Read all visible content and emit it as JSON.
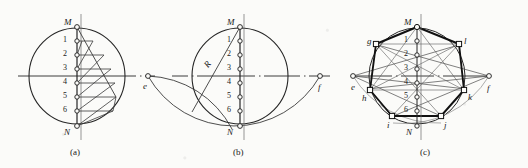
{
  "figure": {
    "captions": [
      {
        "id": "cap-a",
        "text": "(a)",
        "x": 70,
        "y": 148
      },
      {
        "id": "cap-b",
        "text": "(b)",
        "x": 233,
        "y": 148
      },
      {
        "id": "cap-c",
        "text": "(c)",
        "x": 420,
        "y": 148
      }
    ],
    "colors": {
      "ink": "#1a1a1a",
      "line": "#262626",
      "thin": "#3a3a3a",
      "paper": "#fbfbf9",
      "heavy": "#111111"
    }
  },
  "panels": {
    "a": {
      "name": "divide-diameter-panel",
      "center": {
        "x": 77,
        "y": 76
      },
      "radius": 48,
      "endpoints": [
        {
          "label": "M",
          "x": 77,
          "y": 27,
          "lx": 64,
          "ly": 18
        },
        {
          "label": "N",
          "x": 77,
          "y": 126,
          "lx": 64,
          "ly": 128
        }
      ],
      "divisions": [
        {
          "label": "1",
          "x": 77,
          "y": 41,
          "lx": 63,
          "ly": 36
        },
        {
          "label": "2",
          "x": 77,
          "y": 55,
          "lx": 63,
          "ly": 50
        },
        {
          "label": "3",
          "x": 77,
          "y": 69,
          "lx": 63,
          "ly": 64
        },
        {
          "label": "4",
          "x": 77,
          "y": 83,
          "lx": 63,
          "ly": 78
        },
        {
          "label": "5",
          "x": 77,
          "y": 97,
          "lx": 63,
          "ly": 92
        },
        {
          "label": "6",
          "x": 77,
          "y": 111,
          "lx": 63,
          "ly": 106
        }
      ],
      "hatch_count": 6
    },
    "b": {
      "name": "arc-intersection-panel",
      "center": {
        "x": 240,
        "y": 76
      },
      "radius": 48,
      "radius_label": {
        "text": "R",
        "x": 205,
        "y": 60
      },
      "endpoints": [
        {
          "label": "M",
          "x": 240,
          "y": 27,
          "lx": 227,
          "ly": 18
        },
        {
          "label": "N",
          "x": 240,
          "y": 126,
          "lx": 227,
          "ly": 128
        }
      ],
      "divisions": [
        {
          "label": "1",
          "x": 240,
          "y": 41,
          "lx": 227,
          "ly": 36
        },
        {
          "label": "2",
          "x": 240,
          "y": 55,
          "lx": 227,
          "ly": 50
        },
        {
          "label": "3",
          "x": 240,
          "y": 69,
          "lx": 227,
          "ly": 64
        },
        {
          "label": "4",
          "x": 240,
          "y": 83,
          "lx": 227,
          "ly": 78
        },
        {
          "label": "5",
          "x": 240,
          "y": 97,
          "lx": 227,
          "ly": 92
        },
        {
          "label": "6",
          "x": 240,
          "y": 111,
          "lx": 227,
          "ly": 106
        }
      ],
      "poles": [
        {
          "label": "e",
          "x": 148,
          "y": 76,
          "lx": 143,
          "ly": 82
        },
        {
          "label": "f",
          "x": 320,
          "y": 76,
          "lx": 318,
          "ly": 83
        }
      ]
    },
    "c": {
      "name": "heptagon-panel",
      "center": {
        "x": 417,
        "y": 76
      },
      "radius": 48,
      "endpoints": [
        {
          "label": "M",
          "x": 417,
          "y": 27,
          "lx": 404,
          "ly": 18
        },
        {
          "label": "N",
          "x": 417,
          "y": 126,
          "lx": 406,
          "ly": 128
        }
      ],
      "divisions": [
        {
          "label": "1",
          "x": 417,
          "y": 41,
          "lx": 404,
          "ly": 36
        },
        {
          "label": "2",
          "x": 417,
          "y": 55,
          "lx": 404,
          "ly": 50
        },
        {
          "label": "3",
          "x": 417,
          "y": 69,
          "lx": 404,
          "ly": 64
        },
        {
          "label": "4",
          "x": 417,
          "y": 83,
          "lx": 404,
          "ly": 78
        },
        {
          "label": "5",
          "x": 417,
          "y": 97,
          "lx": 404,
          "ly": 92
        },
        {
          "label": "6",
          "x": 417,
          "y": 111,
          "lx": 404,
          "ly": 106
        }
      ],
      "poles": [
        {
          "label": "e",
          "x": 353,
          "y": 76,
          "lx": 351,
          "ly": 83
        },
        {
          "label": "f",
          "x": 489,
          "y": 76,
          "lx": 487,
          "ly": 84
        }
      ],
      "vertices": [
        {
          "label": "M",
          "x": 417,
          "y": 27,
          "lx": 404,
          "ly": 18
        },
        {
          "label": "l",
          "x": 459,
          "y": 44,
          "lx": 464,
          "ly": 38
        },
        {
          "label": "k",
          "x": 464,
          "y": 90,
          "lx": 468,
          "ly": 93
        },
        {
          "label": "j",
          "x": 441,
          "y": 116,
          "lx": 444,
          "ly": 121
        },
        {
          "label": "i",
          "x": 392,
          "y": 116,
          "lx": 387,
          "ly": 121
        },
        {
          "label": "h",
          "x": 370,
          "y": 90,
          "lx": 362,
          "ly": 94
        },
        {
          "label": "g",
          "x": 376,
          "y": 44,
          "lx": 367,
          "ly": 38
        }
      ],
      "ray_targets_from_e": [
        "1",
        "3",
        "5"
      ],
      "ray_targets_from_f": [
        "1",
        "3",
        "5"
      ]
    }
  }
}
